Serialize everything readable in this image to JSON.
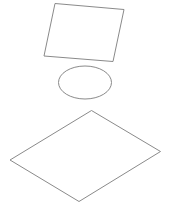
{
  "canvas": {
    "width": 172,
    "height": 212,
    "background": "#ffffff",
    "stroke_color": "#8a8a8a"
  },
  "shapes": [
    {
      "type": "quadrilateral",
      "name": "tilted-rectangle",
      "points": [
        [
          55,
          3.5
        ],
        [
          124,
          9.5
        ],
        [
          113,
          61.5
        ],
        [
          44,
          56
        ]
      ]
    },
    {
      "type": "ellipse",
      "name": "ellipse",
      "cx": 85,
      "cy": 82.5,
      "rx": 26.5,
      "ry": 16.5
    },
    {
      "type": "rhombus",
      "name": "diamond",
      "points": [
        [
          91.5,
          110.5
        ],
        [
          160.5,
          151.5
        ],
        [
          79,
          201.5
        ],
        [
          10,
          160
        ]
      ]
    }
  ]
}
